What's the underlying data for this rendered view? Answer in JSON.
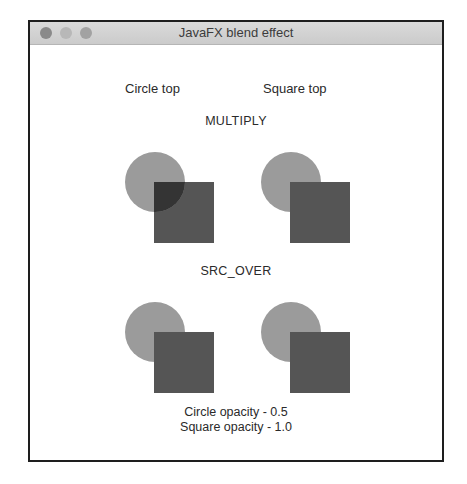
{
  "window": {
    "title": "JavaFX blend effect",
    "traffic_lights": [
      "close",
      "minimize",
      "maximize"
    ]
  },
  "columns": {
    "left": "Circle top",
    "right": "Square top"
  },
  "modes": [
    {
      "label": "MULTIPLY",
      "groups": [
        {
          "name": "circle-top",
          "top_shape": "circle"
        },
        {
          "name": "square-top",
          "top_shape": "square"
        }
      ]
    },
    {
      "label": "SRC_OVER",
      "groups": [
        {
          "name": "circle-top",
          "top_shape": "circle"
        },
        {
          "name": "square-top",
          "top_shape": "square"
        }
      ]
    }
  ],
  "footer": {
    "circle_opacity": "Circle opacity - 0.5",
    "square_opacity": "Square opacity - 1.0"
  },
  "colors": {
    "circle": "#9b9b9b",
    "square": "#555555",
    "multiply_overlap": "#343434",
    "window_border": "#1e1e1e",
    "titlebar": "#d2d2d2"
  }
}
